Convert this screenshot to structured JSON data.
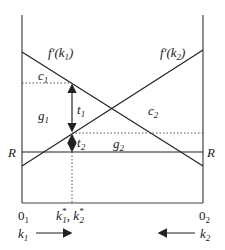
{
  "diagram": {
    "curves": {
      "mpk1_label": "f'(k",
      "mpk1_sub": "1",
      "mpk2_label": "f'(k",
      "mpk2_sub": "2",
      "close": ")"
    },
    "regions": {
      "c1": "c",
      "c1_sub": "1",
      "c2": "c",
      "c2_sub": "2",
      "g1": "g",
      "g1_sub": "1",
      "g2": "g",
      "g2_sub": "2",
      "t1": "t",
      "t1_sub": "1",
      "t2": "t",
      "t2_sub": "2"
    },
    "interest_rate": {
      "left": "R",
      "right": "R"
    },
    "axis": {
      "origin1": "0",
      "origin1_sub": "1",
      "origin2": "0",
      "origin2_sub": "2",
      "equilibrium": "k",
      "eq1_sub": "1",
      "eq2_sub": "2",
      "star": "*",
      "comma": ", "
    },
    "directions": {
      "k1": "k",
      "k1_sub": "1",
      "k2": "k",
      "k2_sub": "2"
    },
    "colors": {
      "line": "#222222",
      "dotted": "#555555",
      "axis": "#444444"
    }
  }
}
